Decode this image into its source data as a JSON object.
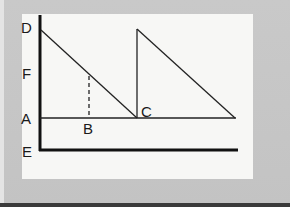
{
  "diagram": {
    "type": "line-diagram",
    "labels": {
      "D": "D",
      "F": "F",
      "A": "A",
      "E": "E",
      "B": "B",
      "C": "C"
    },
    "colors": {
      "background": "#c6c6c6",
      "panel": "#f7f7f5",
      "line": "#1a1a1a"
    },
    "points": {
      "D": [
        40,
        30
      ],
      "C": [
        137,
        118
      ],
      "B_top": [
        89,
        77
      ],
      "B_base": [
        89,
        118
      ],
      "second_peak": [
        137,
        29
      ],
      "second_end": [
        235,
        118
      ]
    }
  }
}
